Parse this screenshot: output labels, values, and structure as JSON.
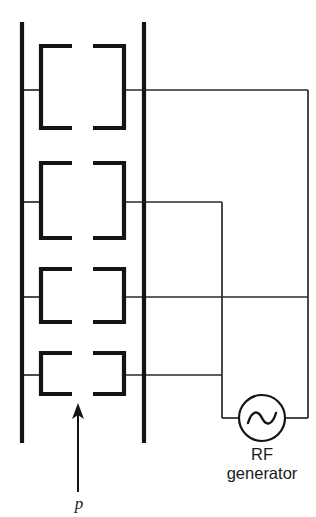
{
  "figure": {
    "name": "quadrupole-rf-ion-guide",
    "background_color": "#ffffff",
    "width": 316,
    "height": 517,
    "stroke_color": "#141414",
    "wire_color": "#2a2a2a"
  },
  "labels": {
    "rf_generator_line1": "RF",
    "rf_generator_line2": "generator",
    "pressure_symbol": "p"
  },
  "icons": {
    "ac_source": "sine-wave-icon",
    "gas_flow": "up-arrow-icon"
  },
  "geometry": {
    "rail_left_x": 22,
    "rail_right_x": 144,
    "rail_top_y": 22,
    "rail_bottom_y": 443,
    "electrode_left_x": 41,
    "electrode_left_inner_x": 72,
    "electrode_right_inner_x": 93,
    "electrode_right_x": 124,
    "bus_mid_x": 222,
    "bus_far_x": 308,
    "source_cx": 262,
    "source_cy": 418,
    "source_r": 23,
    "arrow_x": 78,
    "arrow_tail_y": 492,
    "arrow_tip_y": 404
  },
  "electrodes": [
    {
      "id": "electrode-pair-1",
      "index": 1,
      "top_y": 46,
      "bottom_y": 128,
      "lead_y": 90,
      "lead_bus": 308
    },
    {
      "id": "electrode-pair-2",
      "index": 2,
      "top_y": 163,
      "bottom_y": 238,
      "lead_y": 202,
      "lead_bus": 222
    },
    {
      "id": "electrode-pair-3",
      "index": 3,
      "top_y": 269,
      "bottom_y": 322,
      "lead_y": 297,
      "lead_bus": 308
    },
    {
      "id": "electrode-pair-4",
      "index": 4,
      "top_y": 353,
      "bottom_y": 394,
      "lead_y": 375,
      "lead_bus": 222
    }
  ],
  "text_positions": {
    "rf_line1": {
      "x": 262,
      "y": 460
    },
    "rf_line2": {
      "x": 262,
      "y": 479
    },
    "pressure": {
      "x": 79,
      "y": 508
    }
  }
}
